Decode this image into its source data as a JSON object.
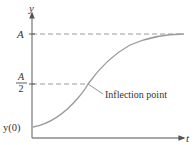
{
  "diagram": {
    "type": "logistic-curve",
    "axes": {
      "y_label": "y",
      "x_label": "t"
    },
    "ticks": {
      "A": "A",
      "A_half_numerator": "A",
      "A_half_denominator": "2",
      "y0": "y(0)"
    },
    "annotation": {
      "inflection_label": "Inflection point"
    },
    "colors": {
      "axis": "#8a8a8a",
      "curve": "#9a9a9a",
      "dashed": "#9a9a9a",
      "text": "#333333"
    }
  }
}
